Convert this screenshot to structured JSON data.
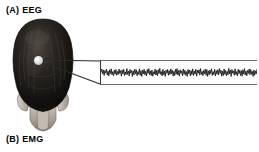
{
  "figure": {
    "width": 259,
    "height": 152,
    "background_color": "#ffffff",
    "ink_color": "#000000"
  },
  "panels": [
    {
      "id": "A",
      "label": "(A)  EEG",
      "letter": "(A)",
      "name": "EEG"
    },
    {
      "id": "B",
      "label": "(B)  EMG",
      "letter": "(B)",
      "name": "EMG"
    }
  ],
  "illustration": {
    "name": "head-posterior-view",
    "description": "shaded drawing of the back of a human head with dark hair, ears and neck",
    "hair_color": "#1a1a1a",
    "skin_color": "#b9b2aa",
    "outline_color": "#4a4a4a"
  },
  "electrode": {
    "name": "scalp-electrode",
    "color": "#e8e8e8",
    "x": 38,
    "y": 60
  },
  "leader": {
    "name": "callout-wedge",
    "color": "#2b2b2b",
    "from_x": 42,
    "from_y": 61,
    "to_x": 100,
    "to_y_top": 61,
    "to_y_bottom": 84
  },
  "trace_panel": {
    "frame_color": "#4a4a4a",
    "trace_color": "#111111",
    "background_color": "#ffffff"
  },
  "chart_data": {
    "type": "line",
    "title": "EEG",
    "xlabel": "",
    "ylabel": "",
    "legend": [],
    "grid": false,
    "axis_visible": "left-bracket-with-top-and-bottom-rails",
    "xlim": [
      0,
      200
    ],
    "ylim": [
      -1,
      1
    ],
    "series": [
      {
        "name": "EEG signal",
        "color": "#111111",
        "values": [
          0.05,
          0.3,
          -0.12,
          0.22,
          -0.26,
          0.18,
          -0.05,
          0.28,
          -0.22,
          0.12,
          -0.3,
          0.24,
          -0.1,
          0.32,
          -0.2,
          0.08,
          -0.28,
          0.2,
          -0.14,
          0.26,
          -0.24,
          0.1,
          -0.18,
          0.3,
          -0.08,
          0.16,
          -0.32,
          0.22,
          -0.12,
          0.28,
          -0.26,
          0.06,
          -0.2,
          0.34,
          -0.16,
          0.12,
          -0.3,
          0.26,
          -0.06,
          0.18,
          -0.34,
          0.14,
          -0.22,
          0.3,
          -0.1,
          0.24,
          -0.28,
          0.08,
          -0.16,
          0.32,
          -0.24,
          0.16,
          -0.34,
          0.2,
          -0.12,
          0.28,
          -0.2,
          0.1,
          -0.3,
          0.26,
          -0.08,
          0.34,
          -0.18,
          0.14,
          -0.26,
          0.22,
          -0.32,
          0.06,
          -0.14,
          0.3,
          -0.22,
          0.18,
          -0.28,
          0.24,
          -0.1,
          0.36,
          -0.16,
          0.08,
          -0.3,
          0.28,
          -0.2,
          0.12,
          -0.34,
          0.22,
          -0.06,
          0.26,
          -0.24,
          0.16,
          -0.18,
          0.32,
          -0.12,
          0.2,
          -0.3,
          0.1,
          -0.26,
          0.28,
          -0.14,
          0.34,
          -0.22,
          0.18,
          -0.32,
          0.24,
          -0.08,
          0.14,
          -0.28,
          0.3,
          -0.16,
          0.2,
          -0.24,
          0.08,
          -0.34,
          0.26,
          -0.1,
          0.22,
          -0.3,
          0.16,
          -0.18,
          0.32,
          -0.26,
          0.12,
          -0.14,
          0.28,
          -0.32,
          0.2,
          -0.06,
          0.24,
          -0.22,
          0.34,
          -0.16,
          0.1,
          -0.28,
          0.18,
          -0.12,
          0.3,
          -0.24,
          0.26,
          -0.34,
          0.14,
          -0.2,
          0.22,
          -0.1,
          0.32,
          -0.26,
          0.08,
          -0.18,
          0.28,
          -0.3,
          0.16,
          -0.14,
          0.24,
          -0.22,
          0.34,
          -0.08,
          0.2,
          -0.32,
          0.12,
          -0.26,
          0.3,
          -0.16,
          0.18,
          -0.28,
          0.1,
          -0.2,
          0.36,
          -0.12,
          0.22,
          -0.34,
          0.26,
          -0.06,
          0.14,
          -0.24,
          0.32,
          -0.18,
          0.08,
          -0.3,
          0.28,
          -0.1,
          0.2,
          -0.26,
          0.16,
          -0.32,
          0.24,
          -0.14,
          0.34,
          -0.22,
          0.12,
          -0.28,
          0.18,
          -0.08,
          0.3,
          -0.2,
          0.26,
          -0.16,
          0.1,
          -0.34,
          0.22,
          -0.24,
          0.14,
          -0.12,
          0.28
        ]
      }
    ]
  }
}
